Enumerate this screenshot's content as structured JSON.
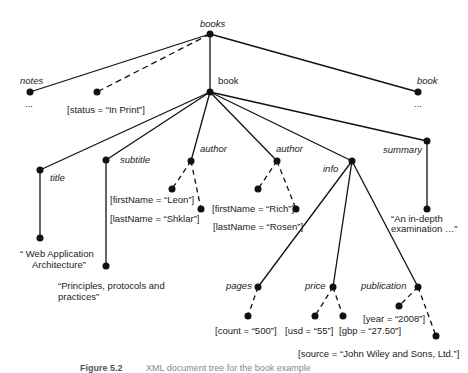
{
  "diagram": {
    "root": {
      "label": "books"
    },
    "nodes": {
      "notes": {
        "label": "notes",
        "ellipsis": "..."
      },
      "status": {
        "label": "[status = “In Print”]"
      },
      "book_main": {
        "label": "book"
      },
      "book_other": {
        "label": "book",
        "ellipsis": "..."
      },
      "title": {
        "label": "title",
        "value_line1": "“ Web Application",
        "value_line2": "Architecture”"
      },
      "subtitle": {
        "label": "subtitle",
        "value_line1": "“Principles, protocols and",
        "value_line2": "practices”"
      },
      "author1": {
        "label": "author",
        "first": "[firstName = “Leon”]",
        "last": "[lastName = “Shklar”]"
      },
      "author2": {
        "label": "author",
        "first": "[firstName = “Rich”]",
        "last": "[lastName = “Rosen”]"
      },
      "info": {
        "label": "info"
      },
      "summary": {
        "label": "summary",
        "value_line1": "“An in-depth",
        "value_line2": "examination …”"
      },
      "pages": {
        "label": "pages",
        "count": "[count = “500”]"
      },
      "price": {
        "label": "price",
        "usd": "[usd = “55”]",
        "gbp": "[gbp = “27.50”]"
      },
      "publication": {
        "label": "publication",
        "year": "[year = “2008”]",
        "source": "[source = “John Wiley and Sons, Ltd.”]"
      }
    },
    "caption": {
      "figure": "Figure 5.2",
      "text": "XML document tree for the book example"
    }
  }
}
